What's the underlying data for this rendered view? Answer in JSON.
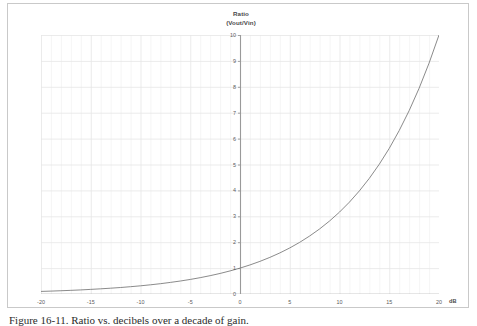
{
  "figure": {
    "caption": "Figure 16-11.  Ratio vs. decibels over a decade of gain.",
    "background_color": "#ffffff",
    "frame_color": "#c9c9c9"
  },
  "chart_data": {
    "type": "line",
    "title": "Ratio (Vout/Vin)",
    "title_lines": [
      "Ratio",
      "(Vout/Vin)"
    ],
    "xlabel": "dB",
    "ylabel": "",
    "xlim": [
      -20,
      20
    ],
    "ylim": [
      0,
      10
    ],
    "grid": true,
    "grid_color": "#e6e6e6",
    "minor_grid_color": "#f0f0f0",
    "axis_color": "#9a9a9a",
    "legend": null,
    "legend_position": "none",
    "x_major_step": 5,
    "x_minor_step": 1,
    "y_major_step": 1,
    "xticks": [
      -20,
      -15,
      -10,
      -5,
      0,
      5,
      10,
      15,
      20
    ],
    "xtick_labels": [
      "-20",
      "-15",
      "-10",
      "-5",
      "0",
      "5",
      "10",
      "15",
      "20"
    ],
    "yticks": [
      0,
      1,
      2,
      3,
      4,
      5,
      6,
      7,
      8,
      9,
      10
    ],
    "ytick_labels": [
      "0",
      "1",
      "2",
      "3",
      "4",
      "5",
      "6",
      "7",
      "8",
      "9",
      "10"
    ],
    "series": [
      {
        "name": "Ratio = 10^(dB/20)",
        "color": "#7d7d7d",
        "line_width": 0.9,
        "x": [
          -20,
          -19,
          -18,
          -17,
          -16,
          -15,
          -14,
          -13,
          -12,
          -11,
          -10,
          -9,
          -8,
          -7,
          -6,
          -5,
          -4,
          -3,
          -2,
          -1,
          0,
          1,
          2,
          3,
          4,
          5,
          6,
          7,
          8,
          9,
          10,
          11,
          12,
          13,
          14,
          15,
          16,
          17,
          18,
          19,
          20
        ],
        "values": [
          0.1,
          0.112,
          0.126,
          0.141,
          0.158,
          0.178,
          0.2,
          0.224,
          0.251,
          0.282,
          0.316,
          0.355,
          0.398,
          0.447,
          0.501,
          0.562,
          0.631,
          0.708,
          0.794,
          0.891,
          1.0,
          1.122,
          1.259,
          1.413,
          1.585,
          1.778,
          1.995,
          2.239,
          2.512,
          2.818,
          3.162,
          3.548,
          3.981,
          4.467,
          5.012,
          5.623,
          6.31,
          7.079,
          7.943,
          8.913,
          10.0
        ]
      }
    ]
  }
}
